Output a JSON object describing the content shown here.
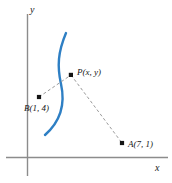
{
  "figure": {
    "type": "coordinate-diagram",
    "background_color": "#ffffff",
    "axes": {
      "x_label": "x",
      "y_label": "y",
      "origin": {
        "x": 27,
        "y": 157
      },
      "axis_color": "#8c8c8c"
    },
    "curve": {
      "name": "hyperbola-branch",
      "color": "#2e7fc4",
      "stroke_width": 2.4,
      "description": "blue arc opening to the right passing through P"
    },
    "points": [
      {
        "id": "P",
        "label": "P(x, y)",
        "px": {
          "x": 71,
          "y": 75
        },
        "dot_color": "#141414"
      },
      {
        "id": "B",
        "label": "B(1, 4)",
        "coords": [
          1,
          4
        ],
        "px": {
          "x": 39,
          "y": 97
        },
        "dot_color": "#141414"
      },
      {
        "id": "A",
        "label": "A(7, 1)",
        "coords": [
          7,
          1
        ],
        "px": {
          "x": 122,
          "y": 143
        },
        "dot_color": "#141414"
      }
    ],
    "connectors": [
      {
        "id": "BP",
        "from": "B",
        "to": "P",
        "style": "dashed",
        "color": "#9a9a9a"
      },
      {
        "id": "PA",
        "from": "P",
        "to": "A",
        "style": "dashed",
        "color": "#9a9a9a"
      }
    ]
  }
}
